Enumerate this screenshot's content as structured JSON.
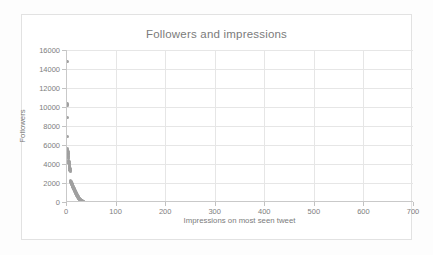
{
  "chart_data": {
    "type": "scatter",
    "title": "Followers and impressions",
    "xlabel": "Impressions on most seen tweet",
    "ylabel": "Followers",
    "xlim": [
      0,
      700
    ],
    "ylim": [
      0,
      16000
    ],
    "xticks": [
      0,
      100,
      200,
      300,
      400,
      500,
      600,
      700
    ],
    "yticks": [
      0,
      2000,
      4000,
      6000,
      8000,
      10000,
      12000,
      14000,
      16000
    ],
    "xtick_labels": [
      "0",
      "100",
      "200",
      "300",
      "400",
      "500",
      "600",
      "700"
    ],
    "ytick_labels": [
      "0",
      "2000",
      "4000",
      "6000",
      "8000",
      "10000",
      "12000",
      "14000",
      "16000"
    ],
    "grid": true,
    "grid_axes": "both",
    "legend": false,
    "marker_color": "#a0a0a0",
    "grid_color": "#e6e6e6",
    "axis_color": "#c9c9c9",
    "text_color": "#7b7b7b",
    "series": [
      {
        "name": "accounts",
        "points": [
          [
            2,
            14800
          ],
          [
            2,
            10300
          ],
          [
            2,
            10150
          ],
          [
            3,
            8900
          ],
          [
            3,
            6900
          ],
          [
            3,
            5600
          ],
          [
            3,
            5450
          ],
          [
            4,
            5300
          ],
          [
            4,
            5150
          ],
          [
            4,
            5000
          ],
          [
            4,
            4850
          ],
          [
            5,
            4700
          ],
          [
            5,
            4550
          ],
          [
            5,
            4400
          ],
          [
            6,
            4250
          ],
          [
            6,
            4100
          ],
          [
            7,
            3950
          ],
          [
            7,
            3800
          ],
          [
            7,
            3650
          ],
          [
            8,
            3500
          ],
          [
            8,
            3350
          ],
          [
            9,
            3200
          ],
          [
            9,
            2250
          ],
          [
            10,
            2150
          ],
          [
            10,
            2050
          ],
          [
            11,
            2000
          ],
          [
            11,
            1950
          ],
          [
            12,
            1900
          ],
          [
            12,
            1850
          ],
          [
            13,
            1800
          ],
          [
            13,
            1720
          ],
          [
            14,
            1660
          ],
          [
            14,
            1600
          ],
          [
            15,
            1540
          ],
          [
            15,
            1480
          ],
          [
            16,
            1420
          ],
          [
            16,
            1360
          ],
          [
            17,
            1300
          ],
          [
            17,
            1240
          ],
          [
            18,
            1180
          ],
          [
            18,
            1120
          ],
          [
            19,
            1060
          ],
          [
            19,
            1000
          ],
          [
            20,
            950
          ],
          [
            20,
            900
          ],
          [
            21,
            850
          ],
          [
            21,
            800
          ],
          [
            22,
            750
          ],
          [
            22,
            700
          ],
          [
            23,
            650
          ],
          [
            23,
            600
          ],
          [
            24,
            560
          ],
          [
            24,
            520
          ],
          [
            25,
            480
          ],
          [
            25,
            440
          ],
          [
            26,
            400
          ],
          [
            26,
            370
          ],
          [
            27,
            340
          ],
          [
            27,
            310
          ],
          [
            28,
            280
          ],
          [
            28,
            250
          ],
          [
            29,
            220
          ],
          [
            29,
            195
          ],
          [
            30,
            170
          ],
          [
            30,
            150
          ],
          [
            31,
            130
          ],
          [
            31,
            110
          ],
          [
            32,
            90
          ],
          [
            32,
            75
          ],
          [
            33,
            60
          ],
          [
            33,
            45
          ],
          [
            34,
            30
          ],
          [
            34,
            20
          ],
          [
            35,
            10
          ],
          [
            35,
            5
          ]
        ]
      }
    ]
  }
}
